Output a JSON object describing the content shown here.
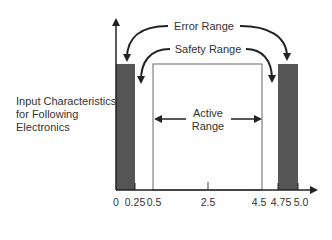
{
  "diagram": {
    "side_label": [
      "Input Characteristics",
      "for Following",
      "Electronics"
    ],
    "error_range_label": "Error Range",
    "safety_range_label": "Safety Range",
    "active_range_label": [
      "Active",
      "Range"
    ],
    "x_ticks": [
      "0",
      "0.25",
      "0.5",
      "2.5",
      "4.5",
      "4.75",
      "5.0"
    ],
    "colors": {
      "error_bar": "#555555",
      "line": "#222222",
      "box": "#666666"
    }
  }
}
